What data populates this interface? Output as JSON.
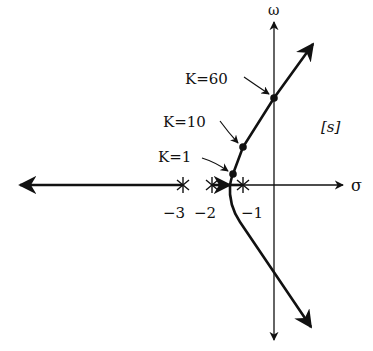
{
  "diagram": {
    "type": "root-locus",
    "axes": {
      "real_axis_label": "σ",
      "imag_axis_label": "ω",
      "plane_label": "[s]"
    },
    "poles": [
      {
        "value": -3,
        "label": "−3"
      },
      {
        "value": -2,
        "label": "−2"
      },
      {
        "value": -1,
        "label": "−1"
      }
    ],
    "gain_points": [
      {
        "label": "K=1"
      },
      {
        "label": "K=10"
      },
      {
        "label": "K=60"
      }
    ]
  }
}
